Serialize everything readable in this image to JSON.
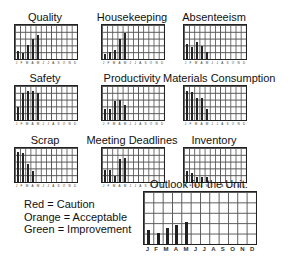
{
  "months": [
    "J",
    "F",
    "M",
    "A",
    "M",
    "J",
    "J",
    "A",
    "S",
    "O",
    "N",
    "D"
  ],
  "legend": [
    {
      "label": "Red = Caution",
      "color": "#d32f2f"
    },
    {
      "label": "Orange = Acceptable",
      "color": "#f57c00"
    },
    {
      "label": "Green = Improvement",
      "color": "#388e3c"
    }
  ],
  "chart_data": [
    {
      "type": "bar",
      "title": "Quality",
      "categories": [
        "J",
        "F",
        "M",
        "A",
        "M",
        "J",
        "J",
        "A",
        "S",
        "O",
        "N",
        "D"
      ],
      "values": [
        1.2,
        0.9,
        2.0,
        3.0,
        3.6,
        null,
        null,
        null,
        null,
        null,
        null,
        null
      ],
      "ylim": [
        0,
        5
      ],
      "grid": true
    },
    {
      "type": "bar",
      "title": "Housekeeping",
      "categories": [
        "J",
        "F",
        "M",
        "A",
        "M",
        "J",
        "J",
        "A",
        "S",
        "O",
        "N",
        "D"
      ],
      "values": [
        0.8,
        1.0,
        1.3,
        3.0,
        3.8,
        null,
        null,
        null,
        null,
        null,
        null,
        null
      ],
      "ylim": [
        0,
        5
      ],
      "grid": true
    },
    {
      "type": "bar",
      "title": "Absenteeism",
      "categories": [
        "J",
        "F",
        "M",
        "A",
        "M",
        "J",
        "J",
        "A",
        "S",
        "O",
        "N",
        "D"
      ],
      "values": [
        2.2,
        1.7,
        2.5,
        1.9,
        1.0,
        null,
        null,
        null,
        null,
        null,
        null,
        null
      ],
      "ylim": [
        0,
        5
      ],
      "grid": true
    },
    {
      "type": "bar",
      "title": "Safety",
      "categories": [
        "J",
        "F",
        "M",
        "A",
        "M",
        "J",
        "J",
        "A",
        "S",
        "O",
        "N",
        "D"
      ],
      "values": [
        1.9,
        3.9,
        4.2,
        4.2,
        4.0,
        null,
        null,
        null,
        null,
        null,
        null,
        null
      ],
      "ylim": [
        0,
        5
      ],
      "grid": true
    },
    {
      "type": "bar",
      "title": "Productivity",
      "categories": [
        "J",
        "F",
        "M",
        "A",
        "M",
        "J",
        "J",
        "A",
        "S",
        "O",
        "N",
        "D"
      ],
      "values": [
        1.6,
        1.6,
        2.8,
        2.9,
        2.2,
        null,
        null,
        null,
        null,
        null,
        null,
        null
      ],
      "ylim": [
        0,
        5
      ],
      "grid": true
    },
    {
      "type": "bar",
      "title": "Materials Consumption",
      "categories": [
        "J",
        "F",
        "M",
        "A",
        "M",
        "J",
        "J",
        "A",
        "S",
        "O",
        "N",
        "D"
      ],
      "values": [
        4.2,
        4.1,
        3.3,
        3.3,
        1.6,
        null,
        null,
        null,
        null,
        null,
        null,
        null
      ],
      "ylim": [
        0,
        5
      ],
      "grid": true
    },
    {
      "type": "bar",
      "title": "Scrap",
      "categories": [
        "J",
        "F",
        "M",
        "A",
        "M",
        "J",
        "J",
        "A",
        "S",
        "O",
        "N",
        "D"
      ],
      "values": [
        4.4,
        4.3,
        2.7,
        1.6,
        null,
        null,
        null,
        null,
        null,
        null,
        null,
        null
      ],
      "ylim": [
        0,
        5
      ],
      "grid": true
    },
    {
      "type": "bar",
      "title": "Meeting Deadlines",
      "categories": [
        "J",
        "F",
        "M",
        "A",
        "M",
        "J",
        "J",
        "A",
        "S",
        "O",
        "N",
        "D"
      ],
      "values": [
        1.7,
        1.7,
        0.9,
        3.4,
        3.6,
        null,
        null,
        null,
        null,
        null,
        null,
        null
      ],
      "ylim": [
        0,
        5
      ],
      "grid": true
    },
    {
      "type": "bar",
      "title": "Inventory",
      "categories": [
        "J",
        "F",
        "M",
        "A",
        "M",
        "J",
        "J",
        "A",
        "S",
        "O",
        "N",
        "D"
      ],
      "values": [
        1.6,
        1.3,
        0.8,
        0.8,
        0.8,
        null,
        null,
        null,
        null,
        null,
        null,
        null
      ],
      "ylim": [
        0,
        5
      ],
      "grid": true
    },
    {
      "type": "bar",
      "title": "Outlook for the Unit:",
      "categories": [
        "J",
        "F",
        "M",
        "A",
        "M",
        "J",
        "J",
        "A",
        "S",
        "O",
        "N",
        "D"
      ],
      "values": [
        1.3,
        1.1,
        1.5,
        1.8,
        2.1,
        null,
        null,
        null,
        null,
        null,
        null,
        null
      ],
      "ylim": [
        0,
        5
      ],
      "grid": true
    }
  ]
}
